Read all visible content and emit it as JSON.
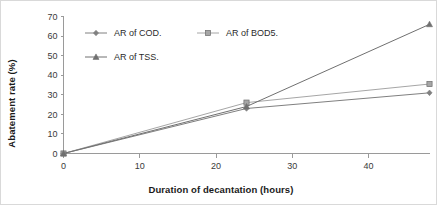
{
  "chart_data": {
    "type": "line",
    "title": "",
    "xlabel": "Duration of decantation (hours)",
    "ylabel": "Abatement rate (%)",
    "x": [
      0,
      24,
      48
    ],
    "xlim": [
      0,
      48
    ],
    "ylim": [
      0,
      70
    ],
    "xticks": [
      0,
      10,
      20,
      30,
      40
    ],
    "yticks": [
      0,
      10,
      20,
      30,
      40,
      50,
      60,
      70
    ],
    "grid": false,
    "legend_position": "upper-left-inside",
    "series": [
      {
        "name": "AR of COD.",
        "values": [
          0,
          23,
          31
        ],
        "marker": "diamond",
        "color": "#808080"
      },
      {
        "name": "AR of BOD5.",
        "values": [
          0,
          26,
          35.5
        ],
        "marker": "square",
        "color": "#a6a6a6"
      },
      {
        "name": "AR of TSS.",
        "values": [
          0,
          24,
          66
        ],
        "marker": "triangle",
        "color": "#707070"
      }
    ]
  },
  "axes": {
    "y_tick_labels": [
      "0",
      "10",
      "20",
      "30",
      "40",
      "50",
      "60",
      "70"
    ],
    "x_tick_labels": [
      "0",
      "10",
      "20",
      "30",
      "40"
    ],
    "y_title": "Abatement rate (%)",
    "x_title": "Duration of decantation (hours)"
  },
  "legend": {
    "items": [
      {
        "label": "AR of COD."
      },
      {
        "label": "AR of BOD5."
      },
      {
        "label": "AR of TSS."
      }
    ]
  }
}
